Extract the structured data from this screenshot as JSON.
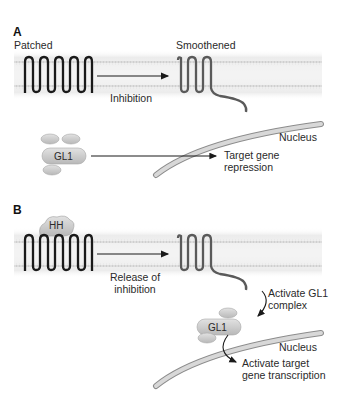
{
  "figure": {
    "panels": [
      {
        "id": "A",
        "label": "A",
        "receptor_left": "Patched",
        "receptor_right": "Smoothened",
        "arrow_label": "Inhibition",
        "complex_label": "GL1",
        "nucleus_label": "Nucleus",
        "outcome_line1": "Target gene",
        "outcome_line2": "repression"
      },
      {
        "id": "B",
        "label": "B",
        "ligand_label": "HH",
        "arrow_label_line1": "Release of",
        "arrow_label_line2": "inhibition",
        "activate_line1": "Activate GL1",
        "activate_line2": "complex",
        "complex_label": "GL1",
        "nucleus_label": "Nucleus",
        "outcome_line1": "Activate target",
        "outcome_line2": "gene transcription"
      }
    ],
    "colors": {
      "patched": "#1a1a1a",
      "smoothened": "#5a5a5a",
      "membrane": "#d8d8d8",
      "protein_fill": "#c8c8c8",
      "nucleus_fill": "#cfcfcf"
    }
  }
}
